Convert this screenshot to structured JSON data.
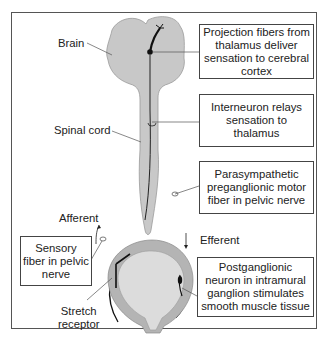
{
  "labels": {
    "brain": "Brain",
    "spinal_cord": "Spinal cord",
    "afferent": "Afferent",
    "efferent": "Efferent",
    "stretch_receptor_line1": "Stretch",
    "stretch_receptor_line2": "receptor"
  },
  "boxes": {
    "projection": "Projection fibers from thalamus deliver sensation to cerebral cortex",
    "interneuron": "Interneuron relays sensation to thalamus",
    "parasympathetic": "Parasympathetic preganglionic motor fiber in pelvic nerve",
    "postganglionic": "Postganglionic neuron in intramural ganglion stimulates smooth muscle tissue",
    "sensory": "Sensory fiber in pelvic nerve"
  },
  "colors": {
    "tissue": "#c8c8c8",
    "bladder_wall": "#b4b4b4",
    "bladder_lumen": "#dcdcdc",
    "nerve": "#1a1a1a",
    "leader": "#666666"
  }
}
